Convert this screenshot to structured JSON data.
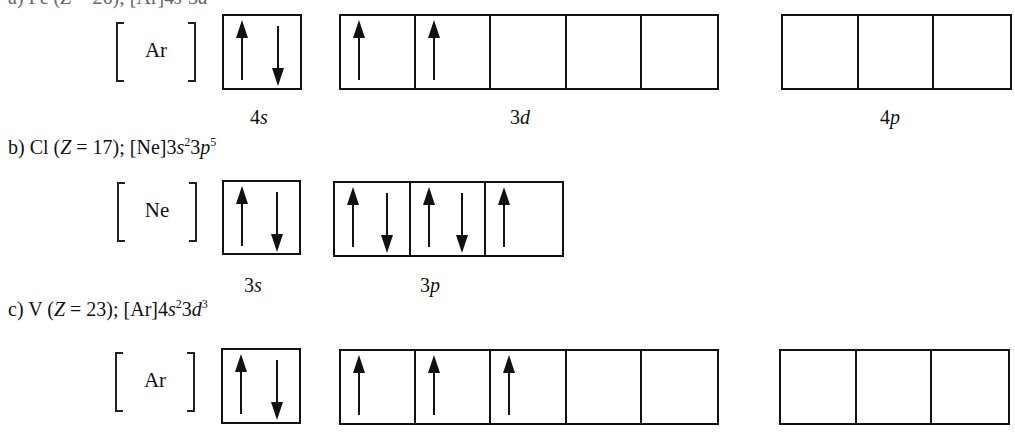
{
  "rows": [
    {
      "id": "a",
      "heading": {
        "prefix": "a)",
        "element": "Fe",
        "z_label": "Z",
        "z_value": "26",
        "config": "[Ar]4s²3d⁶",
        "visible": "partially cut off at top"
      },
      "core": "Ar",
      "subshells": [
        {
          "name": "4s",
          "n": "4",
          "l": "s",
          "boxes": [
            [
              "up",
              "down"
            ]
          ]
        },
        {
          "name": "3d",
          "n": "3",
          "l": "d",
          "boxes": [
            [
              "up"
            ],
            [
              "up"
            ],
            [],
            [],
            []
          ]
        },
        {
          "name": "4p",
          "n": "4",
          "l": "p",
          "boxes": [
            [],
            [],
            []
          ]
        }
      ]
    },
    {
      "id": "b",
      "heading": {
        "prefix": "b)",
        "element": "Cl",
        "z_label": "Z",
        "z_value": "17",
        "core": "[Ne]",
        "terms": [
          {
            "n": "3",
            "l": "s",
            "sup": "2"
          },
          {
            "n": "3",
            "l": "p",
            "sup": "5"
          }
        ]
      },
      "core": "Ne",
      "subshells": [
        {
          "name": "3s",
          "n": "3",
          "l": "s",
          "boxes": [
            [
              "up",
              "down"
            ]
          ]
        },
        {
          "name": "3p",
          "n": "3",
          "l": "p",
          "boxes": [
            [
              "up",
              "down"
            ],
            [
              "up",
              "down"
            ],
            [
              "up"
            ]
          ]
        }
      ]
    },
    {
      "id": "c",
      "heading": {
        "prefix": "c)",
        "element": "V",
        "z_label": "Z",
        "z_value": "23",
        "core": "[Ar]",
        "terms": [
          {
            "n": "4",
            "l": "s",
            "sup": "2"
          },
          {
            "n": "3",
            "l": "d",
            "sup": "3"
          }
        ]
      },
      "core": "Ar",
      "subshells": [
        {
          "name": "4s",
          "n": "4",
          "l": "s",
          "boxes": [
            [
              "up",
              "down"
            ]
          ]
        },
        {
          "name": "3d",
          "n": "3",
          "l": "d",
          "boxes": [
            [
              "up"
            ],
            [
              "up"
            ],
            [
              "up"
            ],
            [],
            []
          ]
        },
        {
          "name": "4p",
          "n": "4",
          "l": "p",
          "boxes": [
            [],
            [],
            []
          ]
        }
      ]
    }
  ],
  "text": {
    "b_prefix": "b) Cl (",
    "b_z": "Z",
    "b_eq": " = 17); [Ne]3",
    "b_s": "s",
    "b_s_sup": "2",
    "b_3": "3",
    "b_p": "p",
    "b_p_sup": "5",
    "c_prefix": "c) V (",
    "c_z": "Z",
    "c_eq": " = 23); [Ar]4",
    "c_s": "s",
    "c_s_sup": "2",
    "c_3": "3",
    "c_d": "d",
    "c_d_sup": "3",
    "a_core": "Ar",
    "b_core": "Ne",
    "c_core": "Ar",
    "a_4s_n": "4",
    "a_4s_l": "s",
    "a_3d_n": "3",
    "a_3d_l": "d",
    "a_4p_n": "4",
    "a_4p_l": "p",
    "b_3s_n": "3",
    "b_3s_l": "s",
    "b_3p_n": "3",
    "b_3p_l": "p"
  },
  "colors": {
    "ink": "#111111",
    "background": "#ffffff"
  }
}
